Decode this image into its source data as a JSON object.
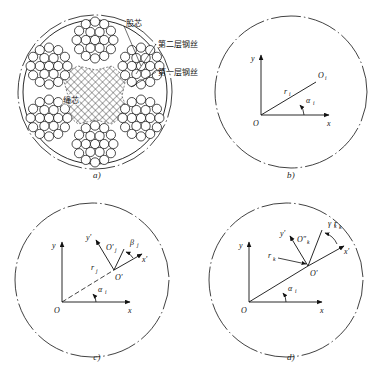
{
  "figure": {
    "title_implicit": "Wire rope cross-section and coordinate systems",
    "panels": [
      {
        "id": "a",
        "caption": "a)",
        "type": "wire-rope-cross-section",
        "callouts": [
          {
            "name": "strand-core",
            "text": "股芯"
          },
          {
            "name": "second-layer-wire",
            "text": "第二层钢丝"
          },
          {
            "name": "first-layer-wire",
            "text": "第一层钢丝"
          }
        ],
        "center_label": {
          "name": "rope-core",
          "text": "绳芯"
        },
        "strand_count": 6,
        "outline_style": "dash-dot"
      },
      {
        "id": "b",
        "caption": "b)",
        "type": "coordinate-diagram",
        "labels": {
          "origin": "O",
          "x_axis": "x",
          "y_axis": "y",
          "point": "O",
          "point_sub": "i",
          "radius": "r",
          "radius_sub": "i",
          "angle": "α",
          "angle_sub": "i"
        }
      },
      {
        "id": "c",
        "caption": "c)",
        "type": "coordinate-diagram",
        "labels": {
          "origin": "O",
          "x_axis": "x",
          "y_axis": "y",
          "local_origin": "O′",
          "local_x_axis": "x′",
          "local_y_axis": "y′",
          "point": "O′",
          "point_sub": "j",
          "radius": "r",
          "radius_sub": "j",
          "angle_global": "α",
          "angle_global_sub": "i",
          "angle_local": "β",
          "angle_local_sub": "j"
        }
      },
      {
        "id": "d",
        "caption": "d)",
        "type": "coordinate-diagram",
        "labels": {
          "origin": "O",
          "x_axis": "x",
          "y_axis": "y",
          "local_origin": "O′",
          "local_x_axis": "x′",
          "local_y_axis": "y′",
          "point": "O″",
          "point_sub": "k",
          "radius_inner": "r",
          "radius_inner_sub": "k",
          "radius_outer": "r",
          "radius_outer_sub": "k",
          "angle_global": "α",
          "angle_global_sub": "i",
          "angle_local": "γ",
          "angle_local_sub": "k"
        }
      }
    ],
    "colors": {
      "line": "#111111",
      "background": "#ffffff",
      "wire_fill": "#ffffff"
    }
  }
}
